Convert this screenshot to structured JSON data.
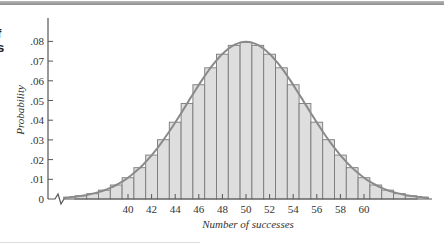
{
  "page": {
    "clipped_margin_text": [
      "f",
      "s"
    ]
  },
  "chart_data": {
    "type": "bar",
    "title": "",
    "xlabel": "Number of successes",
    "ylabel": "Probability",
    "ylim": [
      0,
      0.09
    ],
    "y_ticks": [
      "0",
      ".01",
      ".02",
      ".03",
      ".04",
      ".05",
      ".06",
      ".07",
      ".08"
    ],
    "y_tick_values": [
      0,
      0.01,
      0.02,
      0.03,
      0.04,
      0.05,
      0.06,
      0.07,
      0.08
    ],
    "x_ticks": [
      "40",
      "42",
      "44",
      "46",
      "48",
      "50",
      "52",
      "54",
      "56",
      "58",
      "60"
    ],
    "x_tick_values": [
      40,
      42,
      44,
      46,
      48,
      50,
      52,
      54,
      56,
      58,
      60
    ],
    "axis_break": true,
    "grid": false,
    "legend": null,
    "categories": [
      36,
      37,
      38,
      39,
      40,
      41,
      42,
      43,
      44,
      45,
      46,
      47,
      48,
      49,
      50,
      51,
      52,
      53,
      54,
      55,
      56,
      57,
      58,
      59,
      60,
      61,
      62,
      63,
      64
    ],
    "values": [
      0.0016,
      0.0027,
      0.0045,
      0.0071,
      0.0108,
      0.0159,
      0.0223,
      0.0301,
      0.039,
      0.0485,
      0.058,
      0.0666,
      0.0735,
      0.078,
      0.0796,
      0.078,
      0.0735,
      0.0666,
      0.058,
      0.0485,
      0.039,
      0.0301,
      0.0223,
      0.0159,
      0.0108,
      0.0071,
      0.0045,
      0.0027,
      0.0016
    ],
    "overlay_curve": {
      "type": "normal",
      "mean": 50,
      "sd": 5
    },
    "colors": {
      "bar_fill": "#dedede",
      "bar_stroke": "#7a7a7a",
      "curve": "#8a8a8a",
      "axis": "#555555"
    }
  }
}
